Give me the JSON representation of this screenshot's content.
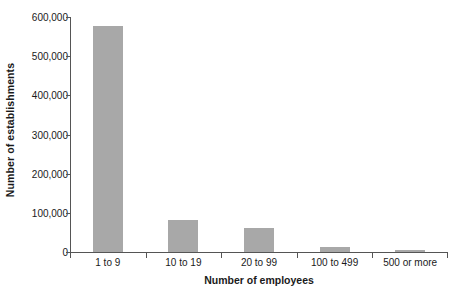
{
  "chart_data": {
    "type": "bar",
    "title": "",
    "subtitle": "",
    "xlabel": "Number of employees",
    "ylabel": "Number of establishments",
    "categories": [
      "1 to 9",
      "10 to 19",
      "20 to 99",
      "100 to 499",
      "500 or more"
    ],
    "values": [
      577000,
      82000,
      61000,
      13000,
      4000
    ],
    "ylim": [
      0,
      600000
    ],
    "yticks": [
      0,
      100000,
      200000,
      300000,
      400000,
      500000,
      600000
    ],
    "ytick_labels": [
      "0",
      "100,000",
      "200,000",
      "300,000",
      "400,000",
      "500,000",
      "600,000"
    ],
    "grid": false,
    "legend": null,
    "bar_color": "#a8a8a8",
    "axis_color": "#555555",
    "background_color": "#ffffff"
  }
}
